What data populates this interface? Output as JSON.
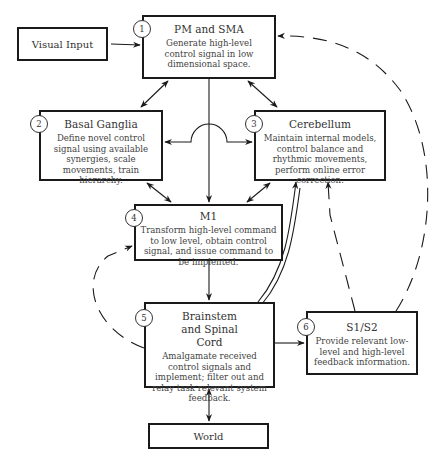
{
  "diagram": {
    "nodes": {
      "visual_input": {
        "label": "Visual Input"
      },
      "pm_sma": {
        "number": "1",
        "title": "PM and SMA",
        "description": "Generate high-level control signal in low dimensional space."
      },
      "basal_ganglia": {
        "number": "2",
        "title": "Basal Ganglia",
        "description": "Define novel control signal using available synergies, scale movements, train hierarchy."
      },
      "cerebellum": {
        "number": "3",
        "title": "Cerebellum",
        "description": "Maintain internal models, control balance and rhythmic movements, perform online error correction."
      },
      "m1": {
        "number": "4",
        "title": "M1",
        "description": "Transform high-level command to low level, obtain control signal, and issue command to be implented."
      },
      "brainstem": {
        "number": "5",
        "title": "Brainstem and Spinal Cord",
        "description": "Amalgamate received control signals and implement; filter out and relay task relevant system feedback."
      },
      "s1s2": {
        "number": "6",
        "title": "S1/S2",
        "description": "Provide relevant low-level and high-level feedback information."
      },
      "world": {
        "label": "World"
      }
    },
    "edges": [
      {
        "from": "Visual Input",
        "to": "PM and SMA",
        "style": "solid"
      },
      {
        "from": "PM and SMA",
        "to": "Basal Ganglia",
        "style": "solid-bidirectional"
      },
      {
        "from": "PM and SMA",
        "to": "Cerebellum",
        "style": "solid-bidirectional"
      },
      {
        "from": "PM and SMA",
        "to": "M1",
        "style": "solid"
      },
      {
        "from": "Basal Ganglia",
        "to": "Cerebellum",
        "style": "solid-bidirectional"
      },
      {
        "from": "Basal Ganglia",
        "to": "M1",
        "style": "solid-bidirectional"
      },
      {
        "from": "Cerebellum",
        "to": "M1",
        "style": "solid-bidirectional"
      },
      {
        "from": "M1",
        "to": "Brainstem and Spinal Cord",
        "style": "solid"
      },
      {
        "from": "Brainstem and Spinal Cord",
        "to": "Cerebellum",
        "style": "solid-double"
      },
      {
        "from": "Brainstem and Spinal Cord",
        "to": "M1",
        "style": "dashed"
      },
      {
        "from": "Brainstem and Spinal Cord",
        "to": "S1/S2",
        "style": "solid"
      },
      {
        "from": "S1/S2",
        "to": "Cerebellum",
        "style": "dashed"
      },
      {
        "from": "S1/S2",
        "to": "PM and SMA",
        "style": "dashed"
      },
      {
        "from": "Brainstem and Spinal Cord",
        "to": "World",
        "style": "solid-bidirectional"
      }
    ]
  }
}
